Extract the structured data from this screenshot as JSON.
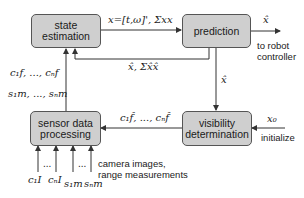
{
  "diagram": {
    "blocks": {
      "state_estimation": "state\nestimation",
      "prediction": "prediction",
      "sensor_data_processing": "sensor data\nprocessing",
      "visibility_determination": "visibility\ndetermination"
    },
    "edge_labels": {
      "state_to_prediction": "x=[t,ω]', Σxx",
      "prediction_to_state": "x̂, Σx̂x̂",
      "prediction_output": "x̂",
      "to_robot_controller": "to robot\ncontroller",
      "prediction_to_visibility": "x̂",
      "visibility_to_sensor": "c₁f̂, ..., cₙf̂",
      "initial_input": "x₀",
      "initialize": "initialize",
      "sensor_to_state_features": "c₁f, ..., cₙf",
      "sensor_to_state_measurements": "s₁m, ..., sₙm",
      "sensor_inputs": [
        "c₁I",
        "...",
        "cₙI",
        "s₁m",
        "...",
        "sₙm"
      ],
      "sensor_inputs_caption": "camera images,\nrange measurements"
    },
    "colors": {
      "block_fill": "#cfcfcf",
      "block_border": "#555555",
      "line": "#333333"
    }
  }
}
